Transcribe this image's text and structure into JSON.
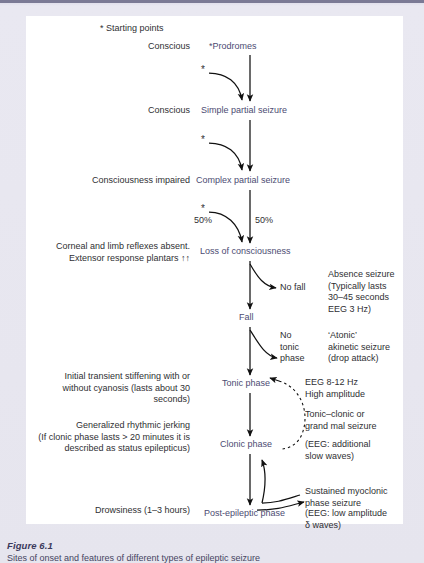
{
  "figure": {
    "caption_title": "Figure 6.1",
    "caption_body": "Sites of onset and features of different types of epileptic seizure"
  },
  "legend": {
    "starting_points": "* Starting points"
  },
  "flow": {
    "nodes": [
      {
        "id": "prodromes",
        "label": "*Prodromes"
      },
      {
        "id": "simple-partial-seizure",
        "label": "Simple partial seizure"
      },
      {
        "id": "complex-partial-seizure",
        "label": "Complex partial seizure"
      },
      {
        "id": "loss-of-consciousness",
        "label": "Loss of consciousness"
      },
      {
        "id": "fall",
        "label": "Fall"
      },
      {
        "id": "tonic-phase",
        "label": "Tonic phase"
      },
      {
        "id": "clonic-phase",
        "label": "Clonic phase"
      },
      {
        "id": "post-epileptic-phase",
        "label": "Post-epileptic phase"
      }
    ],
    "branches": [
      {
        "id": "no-fall",
        "label": "No fall"
      },
      {
        "id": "no-tonic-phase",
        "label": "No\ntonic\nphase"
      }
    ],
    "percentages": {
      "left": "50%",
      "right": "50%"
    },
    "stars": {
      "simple_partial_star": "*",
      "complex_partial_star": "*",
      "loss_of_consciousness_star": "*"
    }
  },
  "left_labels": [
    {
      "id": "conscious-1",
      "text": "Conscious"
    },
    {
      "id": "conscious-2",
      "text": "Conscious"
    },
    {
      "id": "consciousness-impaired",
      "text": "Consciousness impaired"
    },
    {
      "id": "corneal-reflexes",
      "text": "Corneal and limb reflexes absent.\nExtensor response plantars ↑↑"
    },
    {
      "id": "initial-stiffening",
      "text": "Initial transient stiffening with or\nwithout cyanosis (lasts about 30\nseconds)"
    },
    {
      "id": "generalized-jerking",
      "text": "Generalized rhythmic jerking\n(If clonic phase lasts > 20 minutes it is\ndescribed as status epilepticus)"
    },
    {
      "id": "drowsiness",
      "text": "Drowsiness (1–3 hours)"
    }
  ],
  "right_annotations": [
    {
      "id": "absence-seizure",
      "text": "Absence seizure\n(Typically lasts\n30–45 seconds\nEEG 3 Hz)"
    },
    {
      "id": "atonic-akinetic-seizure",
      "text": "‘Atonic’\nakinetic seizure\n(drop attack)"
    },
    {
      "id": "eeg-tonic",
      "text": "EEG 8-12 Hz\nHigh amplitude"
    },
    {
      "id": "tonic-clonic-seizure",
      "text": "Tonic–clonic or\ngrand mal seizure"
    },
    {
      "id": "eeg-clonic",
      "text": "(EEG: additional\nslow waves)"
    },
    {
      "id": "sustained-myoclonic",
      "text": "Sustained myoclonic\nphase seizure"
    },
    {
      "id": "eeg-post",
      "text": "(EEG: low amplitude\nδ waves)"
    }
  ],
  "colors": {
    "page_background": "#e6e5ee",
    "figure_background": "#ffffff",
    "node_text": "#4b4a6e",
    "label_text": "#2f2f33",
    "rule": "#7b7a95",
    "caption_title": "#3b3a5c"
  }
}
